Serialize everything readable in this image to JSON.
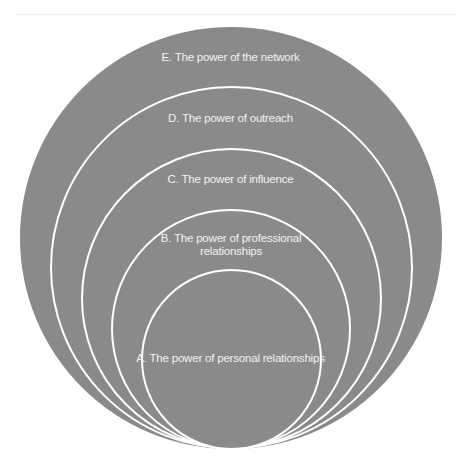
{
  "diagram": {
    "type": "nested-circles",
    "fill_color": "#8a8a8a",
    "stroke_color": "#ffffff",
    "levels": [
      {
        "id": "E",
        "label": "E. The power of the network"
      },
      {
        "id": "D",
        "label": "D. The power of outreach"
      },
      {
        "id": "C",
        "label": "C. The power of influence"
      },
      {
        "id": "B",
        "label": "B. The power of professional relationships"
      },
      {
        "id": "A",
        "label": "A. The power of personal relationships"
      }
    ]
  }
}
